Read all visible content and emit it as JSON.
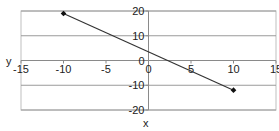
{
  "chart_data": {
    "type": "line",
    "title": "",
    "xlabel": "x",
    "ylabel": "y",
    "xlim": [
      -15,
      15
    ],
    "ylim": [
      -20,
      20
    ],
    "xticks": [
      -15,
      -10,
      -5,
      0,
      5,
      10,
      15
    ],
    "yticks": [
      20,
      10,
      0,
      -10,
      -20
    ],
    "grid": "horizontal",
    "legend": null,
    "series": [
      {
        "name": "line",
        "x": [
          -10,
          10
        ],
        "y": [
          19,
          -12
        ],
        "color": "#333333",
        "marker": "diamond"
      }
    ]
  },
  "labels": {
    "x_axis": "x",
    "y_axis": "y",
    "xtick_labels": [
      "-15",
      "-10",
      "-5",
      "0",
      "5",
      "10",
      "15"
    ],
    "ytick_labels": [
      "20",
      "10",
      "0",
      "-10",
      "-20"
    ]
  }
}
